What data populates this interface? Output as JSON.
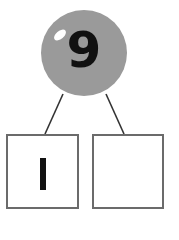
{
  "whole": {
    "value": "9",
    "fill": "#9a9a9a"
  },
  "parts": [
    {
      "value": "1"
    },
    {
      "value": ""
    }
  ],
  "colors": {
    "line": "#333333",
    "box_border": "#6b6b6b",
    "ball": "#9a9a9a"
  }
}
